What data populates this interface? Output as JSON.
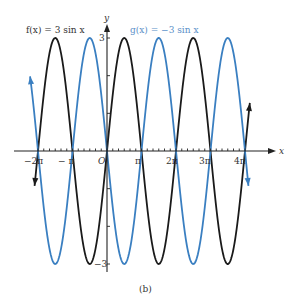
{
  "chart_data": {
    "type": "line",
    "title": "",
    "caption": "(b)",
    "xlabel": "x",
    "ylabel": "y",
    "x_ticks": [
      "-2π",
      "-π",
      "O",
      "π",
      "2π",
      "3π",
      "4π"
    ],
    "y_ticks": [
      "3",
      "-3"
    ],
    "xlim": [
      "-2.2π",
      "4.2π"
    ],
    "ylim": [
      -3,
      3
    ],
    "grid": false,
    "series": [
      {
        "name": "f(x) = 3 sin x",
        "expr": "3*sin(x)",
        "color": "#1a1a1a"
      },
      {
        "name": "g(x) = −3 sin x",
        "expr": "-3*sin(x)",
        "color": "#3a7fc1"
      }
    ]
  },
  "labels": {
    "f": "f(x) = 3 sin x",
    "g": "g(x) = −3 sin x",
    "x_axis": "x",
    "y_axis": "y",
    "y_max": "3",
    "y_min": "−3",
    "xt0": "−2π",
    "xt1": "− π",
    "xt2": "O",
    "xt3": "π",
    "xt4": "2π",
    "xt5": "3π",
    "xt6": "4π",
    "caption": "(b)"
  }
}
